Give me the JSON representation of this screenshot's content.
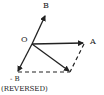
{
  "diagram": {
    "type": "vector-subtraction",
    "labels": {
      "origin": "O",
      "vector_b": "B",
      "vector_a": "A",
      "vector_neg_b": "- B",
      "note": "(REVERSED)"
    },
    "points": {
      "O": [
        32,
        44
      ],
      "B": [
        46,
        14
      ],
      "A": [
        84,
        43
      ],
      "negB": [
        17,
        72
      ],
      "R": [
        70,
        72
      ]
    },
    "colors": {
      "ink": "#222222",
      "background": "#ffffff"
    }
  }
}
